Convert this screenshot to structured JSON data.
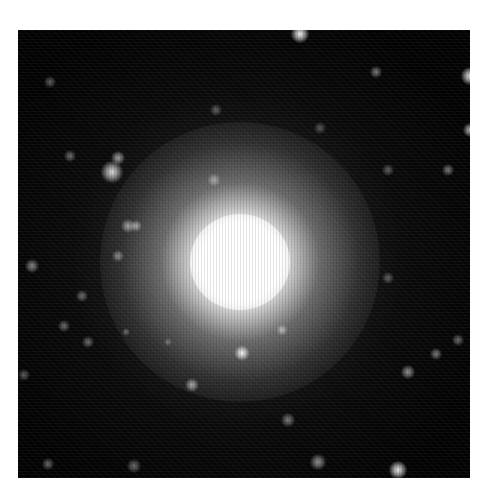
{
  "image": {
    "alt": "Astronomical image of a bright central star or galaxy core surrounded by a diffuse glow and scattered fainter stars on a black sky",
    "colors": {
      "background": "#ffffff",
      "sky": "#020202",
      "core": "#ffffff"
    },
    "frame": {
      "left": 18,
      "top": 30,
      "width": 452,
      "height": 448
    },
    "core": {
      "x": 222,
      "y": 232
    },
    "stars": [
      {
        "x": 282,
        "y": 4,
        "size": 18,
        "brightness": 0.95
      },
      {
        "x": 452,
        "y": 46,
        "size": 18,
        "brightness": 0.9
      },
      {
        "x": 358,
        "y": 42,
        "size": 12,
        "brightness": 0.45
      },
      {
        "x": 32,
        "y": 52,
        "size": 12,
        "brightness": 0.35
      },
      {
        "x": 94,
        "y": 142,
        "size": 22,
        "brightness": 0.85
      },
      {
        "x": 100,
        "y": 128,
        "size": 14,
        "brightness": 0.6
      },
      {
        "x": 52,
        "y": 126,
        "size": 12,
        "brightness": 0.4
      },
      {
        "x": 198,
        "y": 80,
        "size": 12,
        "brightness": 0.35
      },
      {
        "x": 196,
        "y": 150,
        "size": 14,
        "brightness": 0.45
      },
      {
        "x": 452,
        "y": 100,
        "size": 14,
        "brightness": 0.7
      },
      {
        "x": 430,
        "y": 140,
        "size": 12,
        "brightness": 0.45
      },
      {
        "x": 370,
        "y": 140,
        "size": 12,
        "brightness": 0.35
      },
      {
        "x": 302,
        "y": 98,
        "size": 12,
        "brightness": 0.3
      },
      {
        "x": 110,
        "y": 196,
        "size": 14,
        "brightness": 0.55
      },
      {
        "x": 118,
        "y": 196,
        "size": 12,
        "brightness": 0.55
      },
      {
        "x": 100,
        "y": 226,
        "size": 12,
        "brightness": 0.45
      },
      {
        "x": 14,
        "y": 236,
        "size": 14,
        "brightness": 0.5
      },
      {
        "x": 64,
        "y": 266,
        "size": 12,
        "brightness": 0.4
      },
      {
        "x": 46,
        "y": 296,
        "size": 12,
        "brightness": 0.4
      },
      {
        "x": 70,
        "y": 312,
        "size": 12,
        "brightness": 0.4
      },
      {
        "x": 370,
        "y": 248,
        "size": 12,
        "brightness": 0.35
      },
      {
        "x": 440,
        "y": 310,
        "size": 12,
        "brightness": 0.4
      },
      {
        "x": 224,
        "y": 323,
        "size": 16,
        "brightness": 0.95
      },
      {
        "x": 264,
        "y": 300,
        "size": 12,
        "brightness": 0.55
      },
      {
        "x": 174,
        "y": 355,
        "size": 14,
        "brightness": 0.6
      },
      {
        "x": 390,
        "y": 342,
        "size": 14,
        "brightness": 0.55
      },
      {
        "x": 418,
        "y": 324,
        "size": 12,
        "brightness": 0.45
      },
      {
        "x": 270,
        "y": 390,
        "size": 14,
        "brightness": 0.45
      },
      {
        "x": 6,
        "y": 345,
        "size": 12,
        "brightness": 0.35
      },
      {
        "x": 30,
        "y": 434,
        "size": 12,
        "brightness": 0.4
      },
      {
        "x": 116,
        "y": 436,
        "size": 14,
        "brightness": 0.4
      },
      {
        "x": 300,
        "y": 432,
        "size": 16,
        "brightness": 0.55
      },
      {
        "x": 380,
        "y": 440,
        "size": 18,
        "brightness": 0.9
      },
      {
        "x": 108,
        "y": 302,
        "size": 8,
        "brightness": 0.35
      },
      {
        "x": 150,
        "y": 312,
        "size": 8,
        "brightness": 0.3
      }
    ]
  }
}
